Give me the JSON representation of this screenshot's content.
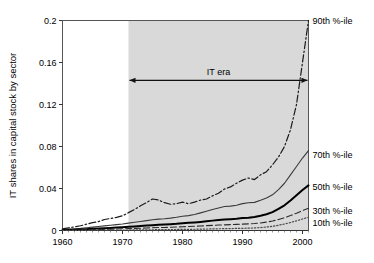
{
  "chart_data": {
    "type": "line",
    "title": "",
    "xlabel": "",
    "ylabel": "IT shares in capital stock by sector",
    "xlim": [
      1960,
      2001
    ],
    "ylim": [
      0,
      0.2
    ],
    "grid": false,
    "legend_position": "right-inline",
    "x_ticks": [
      "1960",
      "1970",
      "1980",
      "1990",
      "2000"
    ],
    "x_tick_values": [
      1960,
      1970,
      1980,
      1990,
      2000
    ],
    "y_ticks": [
      "0",
      "0.04",
      "0.08",
      "0.12",
      "0.16",
      "0.2"
    ],
    "y_tick_values": [
      0,
      0.04,
      0.08,
      0.12,
      0.16,
      0.2
    ],
    "annotations": [
      {
        "text": "IT era",
        "type": "double-arrow-span",
        "x_start": 1971,
        "x_end": 2001,
        "y": 0.143
      }
    ],
    "shaded_region": {
      "x_start": 1971,
      "x_end": 2001,
      "color": "#d9d9d9"
    },
    "x": [
      1960,
      1961,
      1962,
      1963,
      1964,
      1965,
      1966,
      1967,
      1968,
      1969,
      1970,
      1971,
      1972,
      1973,
      1974,
      1975,
      1976,
      1977,
      1978,
      1979,
      1980,
      1981,
      1982,
      1983,
      1984,
      1985,
      1986,
      1987,
      1988,
      1989,
      1990,
      1991,
      1992,
      1993,
      1994,
      1995,
      1996,
      1997,
      1998,
      1999,
      2000,
      2001
    ],
    "series": [
      {
        "name": "90th %-ile",
        "label": "90th %-ile",
        "style": "dash-dot",
        "color": "#1a1a1a",
        "width": 1.2,
        "values": [
          0.0015,
          0.0025,
          0.0035,
          0.0045,
          0.006,
          0.0075,
          0.0085,
          0.0105,
          0.0115,
          0.0125,
          0.014,
          0.017,
          0.02,
          0.0235,
          0.0265,
          0.03,
          0.029,
          0.0265,
          0.025,
          0.0255,
          0.027,
          0.0255,
          0.027,
          0.029,
          0.03,
          0.033,
          0.0355,
          0.0395,
          0.0415,
          0.045,
          0.048,
          0.05,
          0.0485,
          0.053,
          0.056,
          0.0625,
          0.07,
          0.08,
          0.096,
          0.12,
          0.16,
          0.2
        ]
      },
      {
        "name": "70th %-ile",
        "label": "70th %-ile",
        "style": "solid-thin",
        "color": "#3a3a3a",
        "width": 1.1,
        "values": [
          0.0008,
          0.0012,
          0.0016,
          0.002,
          0.0026,
          0.0032,
          0.0038,
          0.0044,
          0.005,
          0.0056,
          0.0062,
          0.007,
          0.0078,
          0.0086,
          0.0094,
          0.0102,
          0.0108,
          0.0112,
          0.0118,
          0.0126,
          0.0136,
          0.0142,
          0.0152,
          0.0168,
          0.0184,
          0.02,
          0.0214,
          0.0228,
          0.0232,
          0.024,
          0.0256,
          0.0264,
          0.0268,
          0.0288,
          0.031,
          0.034,
          0.039,
          0.045,
          0.053,
          0.061,
          0.069,
          0.076
        ]
      },
      {
        "name": "50th %-ile",
        "label": "50th %-ile",
        "style": "solid-thick",
        "color": "#000000",
        "width": 2.0,
        "values": [
          0.0004,
          0.0006,
          0.0008,
          0.001,
          0.0013,
          0.0016,
          0.0019,
          0.0022,
          0.0025,
          0.0028,
          0.0031,
          0.0035,
          0.0039,
          0.0043,
          0.0047,
          0.0051,
          0.0054,
          0.0057,
          0.006,
          0.0064,
          0.007,
          0.0073,
          0.0077,
          0.0082,
          0.0088,
          0.0094,
          0.01,
          0.0104,
          0.0108,
          0.0112,
          0.0118,
          0.0122,
          0.0128,
          0.014,
          0.0155,
          0.0175,
          0.0205,
          0.024,
          0.0285,
          0.0335,
          0.0385,
          0.043
        ]
      },
      {
        "name": "30th %-ile",
        "label": "30th %-ile",
        "style": "dashed",
        "color": "#2a2a2a",
        "width": 1.1,
        "values": [
          0.0002,
          0.0003,
          0.0004,
          0.0005,
          0.0007,
          0.0008,
          0.001,
          0.0011,
          0.0013,
          0.0014,
          0.0016,
          0.0018,
          0.002,
          0.0022,
          0.0024,
          0.0026,
          0.0028,
          0.0029,
          0.0031,
          0.0033,
          0.0036,
          0.0038,
          0.004,
          0.0043,
          0.0046,
          0.0049,
          0.0052,
          0.0054,
          0.0056,
          0.0058,
          0.0061,
          0.0063,
          0.0066,
          0.0072,
          0.008,
          0.009,
          0.0105,
          0.0122,
          0.0142,
          0.0165,
          0.019,
          0.0212
        ]
      },
      {
        "name": "10th %-ile",
        "label": "10th %-ile",
        "style": "dotted",
        "color": "#4a4a4a",
        "width": 1.2,
        "values": [
          5e-05,
          8e-05,
          0.00011,
          0.00014,
          0.00018,
          0.00022,
          0.00026,
          0.0003,
          0.00034,
          0.00038,
          0.00043,
          0.00048,
          0.00054,
          0.0006,
          0.00066,
          0.00072,
          0.00078,
          0.00083,
          0.00089,
          0.00096,
          0.00104,
          0.0011,
          0.00118,
          0.00128,
          0.0014,
          0.00152,
          0.00164,
          0.00174,
          0.00184,
          0.00196,
          0.0021,
          0.00224,
          0.00244,
          0.0028,
          0.0033,
          0.004,
          0.005,
          0.0062,
          0.0076,
          0.0092,
          0.011,
          0.0126
        ]
      }
    ]
  }
}
